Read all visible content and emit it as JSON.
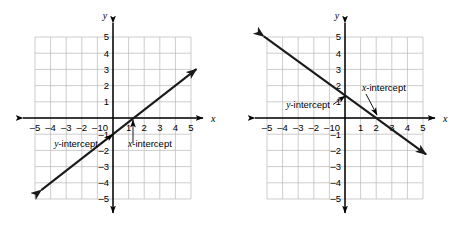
{
  "figure": {
    "background": "#ffffff",
    "line_color": "#1a1a1a",
    "grid_color": "#b8b8b8",
    "axis_color": "#000000",
    "width": 467,
    "height": 226
  },
  "chart_data": [
    {
      "type": "line",
      "title": "",
      "panel": "left",
      "xlabel": "x",
      "ylabel": "y",
      "xlim": [
        -5.5,
        5.5
      ],
      "ylim": [
        -5.5,
        5.5
      ],
      "xticks": [
        -5,
        -4,
        -3,
        -2,
        -1,
        0,
        1,
        2,
        3,
        4,
        5
      ],
      "yticks": [
        5,
        4,
        3,
        2,
        1,
        0,
        -1,
        -2,
        -3,
        -4,
        -5
      ],
      "xtick_labels": [
        "-5",
        "-4",
        "-3",
        "-2",
        "-1",
        "0",
        "1",
        "2",
        "3",
        "4",
        "5"
      ],
      "ytick_labels": [
        "5",
        "4",
        "3",
        "2",
        "1",
        "-1",
        "-2",
        "-3",
        "-4",
        "-5"
      ],
      "grid": true,
      "grid_range": [
        -5,
        5
      ],
      "series": [
        {
          "name": "line-positive-slope",
          "slope": 0.75,
          "y_intercept": -1,
          "x_intercept": 1.33,
          "x_from": -4.6,
          "x_to": 5.35,
          "arrow_start": true,
          "arrow_end": true
        }
      ],
      "annotations": [
        {
          "name": "y-intercept",
          "label": "y-intercept",
          "label_italic_prefix": "y",
          "label_rest": "-intercept",
          "point": [
            0,
            -1
          ],
          "text_anchor": "end"
        },
        {
          "name": "x-intercept",
          "label": "x-intercept",
          "label_italic_prefix": "x",
          "label_rest": "-intercept",
          "point": [
            1.33,
            0
          ],
          "text_anchor": "start"
        }
      ]
    },
    {
      "type": "line",
      "title": "",
      "panel": "right",
      "xlabel": "x",
      "ylabel": "y",
      "xlim": [
        -5.5,
        5.5
      ],
      "ylim": [
        -5.5,
        5.5
      ],
      "xticks": [
        -5,
        -4,
        -3,
        -2,
        -1,
        0,
        1,
        2,
        3,
        4,
        5
      ],
      "yticks": [
        5,
        4,
        3,
        2,
        1,
        0,
        -1,
        -2,
        -3,
        -4,
        -5
      ],
      "xtick_labels": [
        "-5",
        "-4",
        "-3",
        "-2",
        "-1",
        "0",
        "1",
        "2",
        "3",
        "4",
        "5"
      ],
      "ytick_labels": [
        "5",
        "4",
        "3",
        "2",
        "1",
        "-1",
        "-2",
        "-3",
        "-4",
        "-5"
      ],
      "grid": true,
      "grid_range": [
        -5,
        5
      ],
      "series": [
        {
          "name": "line-negative-slope",
          "slope": -0.7,
          "y_intercept": 1.4,
          "x_intercept": 2,
          "x_from": -5.2,
          "x_to": 5.2,
          "arrow_start": true,
          "arrow_end": true
        }
      ],
      "annotations": [
        {
          "name": "y-intercept",
          "label": "y-intercept",
          "label_italic_prefix": "y",
          "label_rest": "-intercept",
          "point": [
            0,
            1.4
          ],
          "text_anchor": "end"
        },
        {
          "name": "x-intercept",
          "label": "x-intercept",
          "label_italic_prefix": "x",
          "label_rest": "-intercept",
          "point": [
            2,
            0
          ],
          "text_anchor": "start"
        }
      ]
    }
  ],
  "labels": {
    "axis_x": "x",
    "axis_y": "y",
    "y_intercept_italic": "y",
    "x_intercept_italic": "x",
    "intercept_suffix": "-intercept",
    "tick_neg5": "-5",
    "tick_neg4": "-4",
    "tick_neg3": "-3",
    "tick_neg2": "-2",
    "tick_neg1": "-1",
    "tick_0": "0",
    "tick_1": "1",
    "tick_2": "2",
    "tick_3": "3",
    "tick_4": "4",
    "tick_5": "5"
  }
}
